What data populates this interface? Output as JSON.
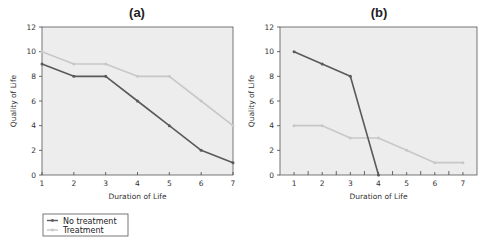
{
  "chart_data": [
    {
      "type": "line",
      "title": "(a)",
      "xlabel": "Duration of Life",
      "ylabel": "Quality of Life",
      "x": [
        1,
        2,
        3,
        4,
        5,
        6,
        7
      ],
      "xlim": [
        1,
        7
      ],
      "ylim": [
        0,
        12
      ],
      "yticks": [
        0,
        2,
        4,
        6,
        8,
        10,
        12
      ],
      "series": [
        {
          "name": "No treatment",
          "color": "#5a5a5a",
          "values": [
            9,
            8,
            8,
            6,
            4,
            2,
            1
          ]
        },
        {
          "name": "Treatment",
          "color": "#c8c8c8",
          "values": [
            10,
            9,
            9,
            8,
            8,
            6,
            4
          ]
        }
      ],
      "grid": false
    },
    {
      "type": "line",
      "title": "(b)",
      "xlabel": "Duration of Life",
      "ylabel": "Quality of Life",
      "x": [
        1,
        2,
        3,
        4,
        5,
        6,
        7
      ],
      "xlim": [
        0.5,
        7.5
      ],
      "ylim": [
        0,
        12
      ],
      "yticks": [
        0,
        2,
        4,
        6,
        8,
        10,
        12
      ],
      "series": [
        {
          "name": "No treatment",
          "color": "#5a5a5a",
          "x": [
            1,
            2,
            3,
            4
          ],
          "values": [
            10,
            9,
            8,
            0
          ]
        },
        {
          "name": "Treatment",
          "color": "#c8c8c8",
          "values": [
            4,
            4,
            3,
            3,
            2,
            1,
            1
          ]
        }
      ],
      "grid": false
    }
  ],
  "legend": {
    "position": "bottom-left",
    "items": [
      {
        "label": "No treatment",
        "color": "#5a5a5a"
      },
      {
        "label": "Treatment",
        "color": "#c8c8c8"
      }
    ]
  }
}
